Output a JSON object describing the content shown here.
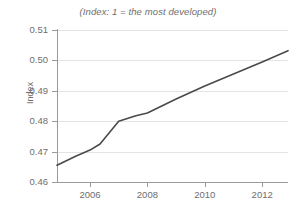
{
  "chart_data": {
    "type": "line",
    "title": "(Index: 1 = the most developed)",
    "xlabel": "",
    "ylabel": "Index",
    "xlim": [
      2004.85,
      2012.9
    ],
    "ylim": [
      0.46,
      0.51
    ],
    "grid": true,
    "legend": false,
    "y_ticks": [
      0.46,
      0.47,
      0.48,
      0.49,
      0.5,
      0.51
    ],
    "y_tick_labels": [
      "0.46",
      "0.47",
      "0.48",
      "0.49",
      "0.50",
      "0.51"
    ],
    "x_ticks": [
      2006,
      2008,
      2010,
      2012
    ],
    "x_tick_labels": [
      "2006",
      "2008",
      "2010",
      "2012"
    ],
    "series": [
      {
        "name": "Index",
        "color": "#4a4a4a",
        "x": [
          2004.85,
          2005.5,
          2006.0,
          2006.35,
          2007.0,
          2007.6,
          2008.0,
          2009.0,
          2010.0,
          2011.0,
          2012.0,
          2012.9
        ],
        "y": [
          0.4655,
          0.4685,
          0.4705,
          0.4725,
          0.48,
          0.4818,
          0.4827,
          0.4873,
          0.4916,
          0.4955,
          0.4995,
          0.5032
        ]
      }
    ]
  },
  "colors": {
    "line": "#4a4a4a",
    "axis": "#9a9a9a",
    "grid": "#e4e4e4",
    "text": "#6e6e6e",
    "background": "#ffffff"
  }
}
